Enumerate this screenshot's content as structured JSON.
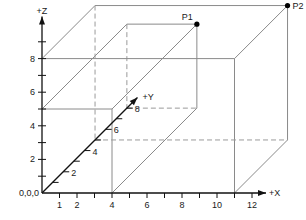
{
  "diagram": {
    "title": "",
    "origin_label": "0,0,0",
    "axes": {
      "x": {
        "label": "+X",
        "ticks": [
          1,
          2,
          3,
          4,
          5,
          6,
          7,
          8,
          9,
          10,
          11,
          12
        ],
        "tick_labels": [
          "1",
          "2",
          "4",
          "6",
          "8",
          "10",
          "12"
        ],
        "tick_label_values": [
          1,
          2,
          4,
          6,
          8,
          10,
          12
        ],
        "max": 12.8
      },
      "y": {
        "label": "+Y",
        "ticks": [
          1,
          2,
          3,
          4,
          5,
          6,
          7,
          8
        ],
        "tick_labels": [
          "2",
          "4",
          "6",
          "8"
        ],
        "tick_label_values": [
          2,
          4,
          6,
          8
        ],
        "max": 9
      },
      "z": {
        "label": "+Z",
        "ticks": [
          1,
          2,
          3,
          4,
          5,
          6,
          7,
          8,
          9
        ],
        "tick_labels": [
          "2",
          "4",
          "6",
          "8"
        ],
        "tick_label_values": [
          2,
          4,
          6,
          8
        ],
        "max": 10.5
      }
    },
    "points": [
      {
        "name": "P1",
        "x": 4,
        "y": 8,
        "z": 5
      },
      {
        "name": "P2",
        "x": 11,
        "y": 5,
        "z": 8
      }
    ],
    "boxes": [
      {
        "name": "small-box",
        "corner": "P1",
        "x": 4,
        "y": 8,
        "z": 5
      },
      {
        "name": "large-box",
        "corner": "P2",
        "x": 11,
        "y": 5,
        "z": 8
      }
    ],
    "colors": {
      "axis": "#111111",
      "box": "#8a8a8a",
      "hidden": "#9a9a9a",
      "point": "#000000"
    }
  }
}
